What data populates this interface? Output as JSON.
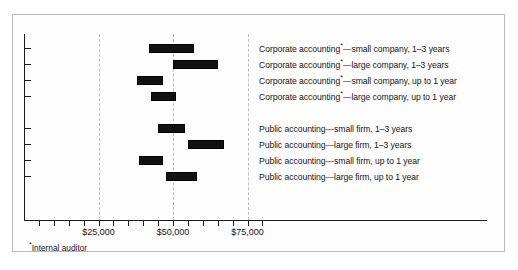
{
  "chart_data": {
    "type": "bar",
    "orientation": "horizontal-range",
    "title": "",
    "subtitle": "",
    "xlabel": "",
    "ylabel": "",
    "xlim": [
      0,
      80000
    ],
    "xtick_labels": [
      "$25,000",
      "$50,000",
      "$75,000"
    ],
    "xtick_values": [
      25000,
      50000,
      75000
    ],
    "minor_tick_values": [
      5000,
      10000,
      15000,
      20000,
      30000,
      35000,
      40000,
      45000,
      55000,
      60000,
      65000,
      70000,
      80000
    ],
    "grid": "vertical-dashed-at-major-ticks",
    "legend": "none",
    "value_format": "USD salary range",
    "categories": [
      "Corporate accounting*—small company, 1–3 years",
      "Corporate accounting*—large company, 1–3 years",
      "Corporate accounting*—small company, up to 1 year",
      "Corporate accounting*—large company, up to 1 year",
      "Public accounting—small firm, 1–3 years",
      "Public accounting—large firm, 1–3 years",
      "Public accounting—small firm, up to 1 year",
      "Public accounting—large firm, up to 1 year"
    ],
    "ranges": [
      {
        "category": "Corporate accounting*—small company, 1–3 years",
        "low": 42000,
        "high": 57000
      },
      {
        "category": "Corporate accounting*—large company, 1–3 years",
        "low": 50000,
        "high": 65000
      },
      {
        "category": "Corporate accounting*—small company, up to 1 year",
        "low": 38000,
        "high": 46500
      },
      {
        "category": "Corporate accounting*—large company, up to 1 year",
        "low": 42500,
        "high": 51000
      },
      {
        "category": "Public accounting—small firm, 1–3 years",
        "low": 45000,
        "high": 54000
      },
      {
        "category": "Public accounting—large firm, 1–3 years",
        "low": 55000,
        "high": 67000
      },
      {
        "category": "Public accounting—small firm, up to 1 year",
        "low": 38500,
        "high": 46500
      },
      {
        "category": "Public accounting—large firm, up to 1 year",
        "low": 47500,
        "high": 58000
      }
    ],
    "bar_color": "#111111",
    "grid_color": "#bcbcbc",
    "axis_color": "#1b1b1b"
  },
  "series_labels": [
    {
      "prefix": "Corporate accounting",
      "marker": "*",
      "suffix": "—small company, 1–3 years"
    },
    {
      "prefix": "Corporate accounting",
      "marker": "*",
      "suffix": "—large company, 1–3 years"
    },
    {
      "prefix": "Corporate accounting",
      "marker": "*",
      "suffix": "—small company, up to 1 year"
    },
    {
      "prefix": "Corporate accounting",
      "marker": "*",
      "suffix": "—large company, up to 1 year"
    },
    {
      "prefix": "Public accounting",
      "marker": "",
      "suffix": "—small firm, 1–3 years"
    },
    {
      "prefix": "Public accounting",
      "marker": "",
      "suffix": "—large firm, 1–3 years"
    },
    {
      "prefix": "Public accounting",
      "marker": "",
      "suffix": "—small firm, up to 1 year"
    },
    {
      "prefix": "Public accounting",
      "marker": "",
      "suffix": "—large firm, up to 1 year"
    }
  ],
  "footnote": {
    "marker": "*",
    "text": "Internal auditor"
  },
  "axis": {
    "tick_labels": [
      "$25,000",
      "$50,000",
      "$75,000"
    ]
  }
}
